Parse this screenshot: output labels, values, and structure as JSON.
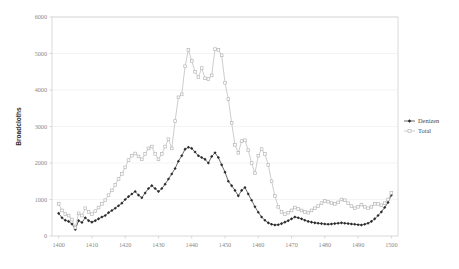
{
  "chart_data": {
    "type": "line",
    "title": "",
    "xlabel": "",
    "ylabel": "Broadcloths",
    "xlim": [
      1398,
      1502
    ],
    "ylim": [
      0,
      6000
    ],
    "xticks": [
      1400,
      1410,
      1420,
      1430,
      1440,
      1450,
      1460,
      1470,
      1480,
      1490,
      1500
    ],
    "yticks": [
      0,
      1000,
      2000,
      3000,
      4000,
      5000,
      6000
    ],
    "grid": true,
    "legend_position": "right",
    "series": [
      {
        "name": "Denizen",
        "color": "#2b2b2b",
        "marker": "diamond",
        "x": [
          1400,
          1401,
          1402,
          1403,
          1404,
          1405,
          1406,
          1407,
          1408,
          1409,
          1410,
          1411,
          1412,
          1413,
          1414,
          1415,
          1416,
          1417,
          1418,
          1419,
          1420,
          1421,
          1422,
          1423,
          1424,
          1425,
          1426,
          1427,
          1428,
          1429,
          1430,
          1431,
          1432,
          1433,
          1434,
          1435,
          1436,
          1437,
          1438,
          1439,
          1440,
          1441,
          1442,
          1443,
          1444,
          1445,
          1446,
          1447,
          1448,
          1449,
          1450,
          1451,
          1452,
          1453,
          1454,
          1455,
          1456,
          1457,
          1458,
          1459,
          1460,
          1461,
          1462,
          1463,
          1464,
          1465,
          1466,
          1467,
          1468,
          1469,
          1470,
          1471,
          1472,
          1473,
          1474,
          1475,
          1476,
          1477,
          1478,
          1479,
          1480,
          1481,
          1482,
          1483,
          1484,
          1485,
          1486,
          1487,
          1488,
          1489,
          1490,
          1491,
          1492,
          1493,
          1494,
          1495,
          1496,
          1497,
          1498,
          1499,
          1500
        ],
        "y": [
          620,
          500,
          430,
          400,
          330,
          180,
          420,
          370,
          500,
          420,
          380,
          420,
          470,
          520,
          560,
          640,
          700,
          760,
          830,
          900,
          1000,
          1080,
          1150,
          1220,
          1120,
          1050,
          1180,
          1300,
          1380,
          1300,
          1220,
          1300,
          1420,
          1560,
          1700,
          1850,
          2050,
          2200,
          2380,
          2430,
          2400,
          2300,
          2200,
          2150,
          2100,
          2000,
          2180,
          2280,
          2150,
          1950,
          1750,
          1500,
          1380,
          1250,
          1100,
          1250,
          1330,
          1150,
          980,
          800,
          650,
          520,
          430,
          360,
          320,
          300,
          310,
          340,
          380,
          420,
          470,
          520,
          500,
          470,
          430,
          400,
          380,
          360,
          350,
          340,
          330,
          320,
          330,
          340,
          350,
          360,
          350,
          340,
          330,
          320,
          310,
          300,
          320,
          350,
          400,
          470,
          560,
          660,
          780,
          920,
          1120
        ]
      },
      {
        "name": "Total",
        "color": "#b8b8b8",
        "marker": "square",
        "x": [
          1400,
          1401,
          1402,
          1403,
          1404,
          1405,
          1406,
          1407,
          1408,
          1409,
          1410,
          1411,
          1412,
          1413,
          1414,
          1415,
          1416,
          1417,
          1418,
          1419,
          1420,
          1421,
          1422,
          1423,
          1424,
          1425,
          1426,
          1427,
          1428,
          1429,
          1430,
          1431,
          1432,
          1433,
          1434,
          1435,
          1436,
          1437,
          1438,
          1439,
          1440,
          1441,
          1442,
          1443,
          1444,
          1445,
          1446,
          1447,
          1448,
          1449,
          1450,
          1451,
          1452,
          1453,
          1454,
          1455,
          1456,
          1457,
          1458,
          1459,
          1460,
          1461,
          1462,
          1463,
          1464,
          1465,
          1466,
          1467,
          1468,
          1469,
          1470,
          1471,
          1472,
          1473,
          1474,
          1475,
          1476,
          1477,
          1478,
          1479,
          1480,
          1481,
          1482,
          1483,
          1484,
          1485,
          1486,
          1487,
          1488,
          1489,
          1490,
          1491,
          1492,
          1493,
          1494,
          1495,
          1496,
          1497,
          1498,
          1499,
          1500
        ],
        "y": [
          880,
          700,
          600,
          560,
          450,
          230,
          620,
          560,
          760,
          660,
          600,
          680,
          780,
          880,
          980,
          1120,
          1250,
          1400,
          1560,
          1700,
          1880,
          2080,
          2200,
          2260,
          2180,
          2100,
          2250,
          2400,
          2450,
          2250,
          2100,
          2250,
          2450,
          2650,
          2400,
          3150,
          3800,
          3880,
          4650,
          5100,
          4800,
          4500,
          4350,
          4600,
          4320,
          4300,
          4400,
          5120,
          5100,
          4950,
          4200,
          3750,
          3100,
          2500,
          2280,
          2600,
          2620,
          2350,
          2000,
          1720,
          2200,
          2380,
          2250,
          1950,
          1500,
          1100,
          800,
          660,
          600,
          640,
          700,
          780,
          740,
          700,
          660,
          640,
          700,
          760,
          820,
          900,
          960,
          940,
          900,
          880,
          920,
          1000,
          980,
          900,
          820,
          760,
          800,
          860,
          800,
          760,
          800,
          880,
          880,
          840,
          900,
          1000,
          1180
        ]
      }
    ]
  },
  "legend": {
    "items": [
      {
        "label": "Denizen"
      },
      {
        "label": "Total"
      }
    ]
  },
  "axis": {
    "y_title": "Broadcloths"
  }
}
